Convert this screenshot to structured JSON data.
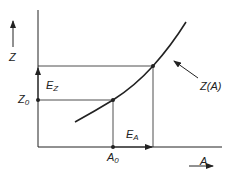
{
  "diagram": {
    "y_axis_label": "Z",
    "x_axis_label": "A",
    "curve_label": "Z(A)",
    "z0_label": "Z",
    "z0_sub": "0",
    "a0_label": "A",
    "a0_sub": "0",
    "ez_label": "E",
    "ez_sub": "Z",
    "ea_label": "E",
    "ea_sub": "A",
    "colors": {
      "line": "#222222",
      "background": "#ffffff"
    }
  }
}
